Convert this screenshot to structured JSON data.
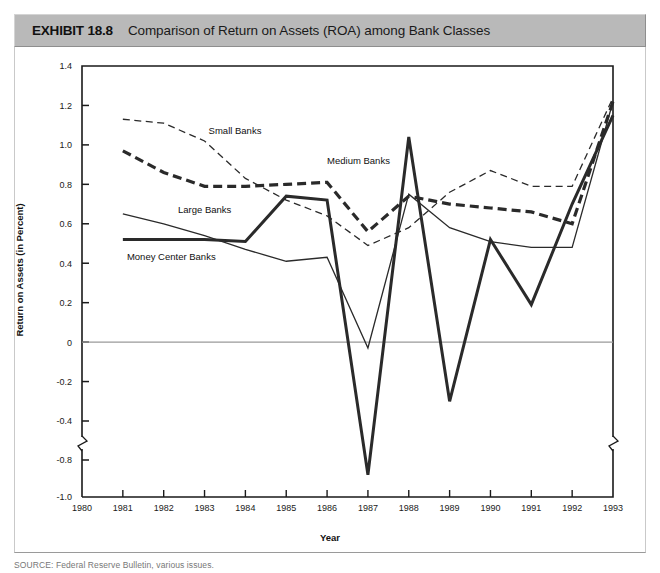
{
  "header": {
    "exhibit_label": "EXHIBIT 18.8",
    "title": "Comparison of Return on Assets (ROA) among Bank Classes"
  },
  "source": {
    "text": "SOURCE: Federal Reserve Bulletin, various issues."
  },
  "colors": {
    "header_band": "#b9b9b9",
    "plot_background": "#ffffff",
    "axis": "#1a1a1a",
    "zero_line": "#9a9a9a",
    "series_line": "#2a2a2a"
  },
  "chart_data": {
    "type": "line",
    "title": "Comparison of Return on Assets (ROA) among Bank Classes",
    "xlabel": "Year",
    "ylabel": "Return on Assets (in Percent)",
    "x": [
      1980,
      1981,
      1982,
      1983,
      1984,
      1985,
      1986,
      1987,
      1988,
      1989,
      1990,
      1991,
      1992,
      1993
    ],
    "xlim": [
      1980,
      1993
    ],
    "ylim": [
      -1.0,
      1.4
    ],
    "yticks": [
      "1.4",
      "1.2",
      "1.0",
      "0.8",
      "0.6",
      "0.4",
      "0.2",
      "0",
      "-0.2",
      "-0.4",
      "-0.8",
      "-1.0"
    ],
    "xticks": [
      "1980",
      "1981",
      "1982",
      "1983",
      "1984",
      "1985",
      "1986",
      "1987",
      "1988",
      "1989",
      "1990",
      "1991",
      "1992",
      "1993"
    ],
    "axis_break": {
      "present": true,
      "between": [
        "-0.4",
        "-0.8"
      ],
      "note": "y-axis broken below -0.4"
    },
    "grid": false,
    "zero_line": true,
    "legend": "inline-labels",
    "series": [
      {
        "name": "Small Banks",
        "style": "thin-dashed",
        "x": [
          1981,
          1982,
          1983,
          1984,
          1985,
          1986,
          1987,
          1988,
          1989,
          1990,
          1991,
          1992,
          1993
        ],
        "values": [
          1.13,
          1.11,
          1.02,
          0.83,
          0.72,
          0.64,
          0.49,
          0.58,
          0.76,
          0.87,
          0.79,
          0.79,
          1.24
        ],
        "label_pos": {
          "x": 1983.1,
          "y": 1.055
        }
      },
      {
        "name": "Medium Banks",
        "style": "thick-dashed",
        "x": [
          1981,
          1982,
          1983,
          1984,
          1985,
          1986,
          1987,
          1988,
          1989,
          1990,
          1991,
          1992,
          1993
        ],
        "values": [
          0.97,
          0.86,
          0.79,
          0.79,
          0.8,
          0.81,
          0.56,
          0.74,
          0.7,
          0.68,
          0.66,
          0.6,
          1.22
        ],
        "label_pos": {
          "x": 1986.0,
          "y": 0.905
        }
      },
      {
        "name": "Large Banks",
        "style": "thin-solid",
        "x": [
          1981,
          1982,
          1983,
          1984,
          1985,
          1986,
          1987,
          1988,
          1989,
          1990,
          1991,
          1992,
          1993
        ],
        "values": [
          0.65,
          0.6,
          0.54,
          0.47,
          0.41,
          0.43,
          -0.03,
          0.75,
          0.58,
          0.51,
          0.48,
          0.48,
          1.22
        ],
        "label_pos": {
          "x": 1982.35,
          "y": 0.655
        }
      },
      {
        "name": "Money Center Banks",
        "style": "thick-solid",
        "x": [
          1981,
          1982,
          1983,
          1984,
          1985,
          1986,
          1987,
          1988,
          1989,
          1990,
          1991,
          1992,
          1993
        ],
        "values": [
          0.52,
          0.52,
          0.52,
          0.51,
          0.74,
          0.72,
          -0.88,
          1.04,
          -0.3,
          0.52,
          0.19,
          0.7,
          1.15
        ],
        "label_pos": {
          "x": 1981.1,
          "y": 0.415
        }
      }
    ]
  }
}
